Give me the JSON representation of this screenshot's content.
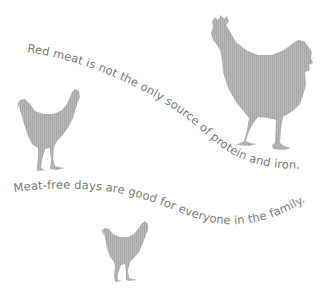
{
  "poster": {
    "background": "#ffffff",
    "silhouette_color": "#b4b4b4",
    "stripe_color": "#a6a6a6",
    "text_color": "#7a7a7a",
    "lines": [
      {
        "text": "Red meat is not the only source of protein and iron."
      },
      {
        "text": "Meat-free days are good for everyone in the family."
      }
    ],
    "illustrations": [
      {
        "icon": "rooster-icon",
        "label": "large rooster silhouette"
      },
      {
        "icon": "hen-icon",
        "label": "small hen silhouette left"
      },
      {
        "icon": "hen-icon",
        "label": "small hen silhouette bottom"
      }
    ]
  }
}
